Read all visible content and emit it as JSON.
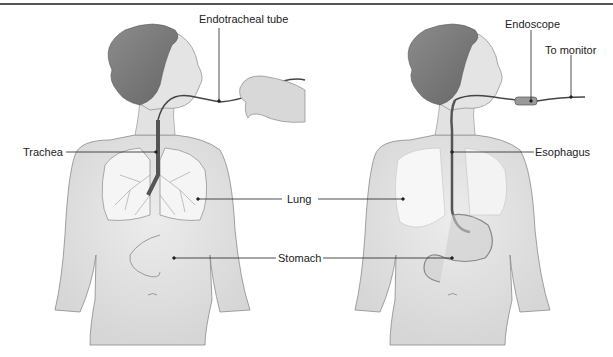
{
  "diagram": {
    "type": "medical-illustration",
    "panels": [
      {
        "name": "intubation",
        "labels": [
          {
            "id": "endotracheal_tube",
            "text": "Endotracheal tube"
          },
          {
            "id": "trachea",
            "text": "Trachea"
          }
        ]
      },
      {
        "name": "endoscopy",
        "labels": [
          {
            "id": "endoscope",
            "text": "Endoscope"
          },
          {
            "id": "to_monitor",
            "text": "To monitor"
          },
          {
            "id": "esophagus",
            "text": "Esophagus"
          }
        ]
      }
    ],
    "shared_labels": [
      {
        "id": "lung",
        "text": "Lung"
      },
      {
        "id": "stomach",
        "text": "Stomach"
      }
    ],
    "colors": {
      "skin": "#e4e4e4",
      "skin_outline": "#8a8a8a",
      "hair": "#7a7a7a",
      "lung": "#f4f4f4",
      "tube": "#444444",
      "leader_line": "#222222",
      "border": "#555555"
    }
  }
}
